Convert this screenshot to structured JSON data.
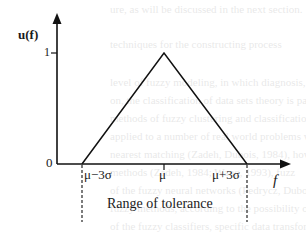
{
  "diagram": {
    "type": "triangular membership function",
    "y_axis_label": "u(f)",
    "y_tick_one": "1",
    "origin_label": "0",
    "x_axis_label": "f",
    "x_ticks": [
      "μ−3σ",
      "μ",
      "μ+3σ"
    ],
    "range_label": "Range of tolerance",
    "points": [
      {
        "x": "μ−3σ",
        "u": 0
      },
      {
        "x": "μ",
        "u": 1
      },
      {
        "x": "μ+3σ",
        "u": 0
      }
    ]
  },
  "background_bleed": [
    "ure, as will be discussed in the next section.",
    "techniques for the constructing process",
    "level of fuzzy modeling, in which diagnosis, e.g.",
    "on, the classification of data sets theory is patter",
    "methods of fuzzy clustering and classification",
    "applied to a number of real world problems w",
    "nearest matching (Zadeh, Dubois, 1984), howe",
    "methods (Zadeh, 1984; Wang, 1993), fuzz",
    "of the fuzzy neural networks (Pedrycz, Dubois, (1984),",
    "fuzzy methods, according to the possibility of",
    "of the fuzzy classifiers, specific data transformation to"
  ]
}
